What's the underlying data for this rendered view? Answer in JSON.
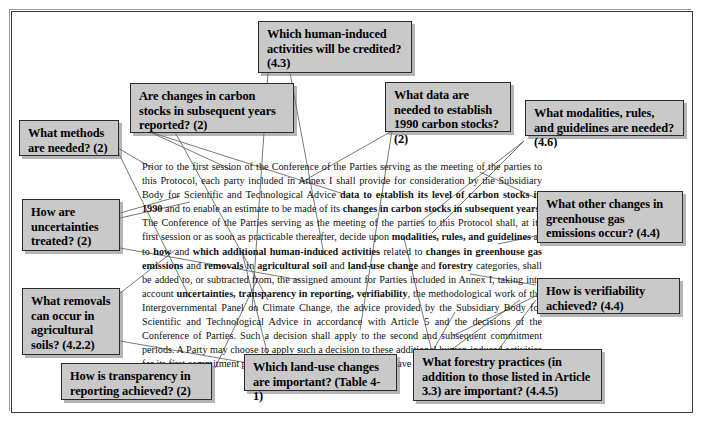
{
  "figure": {
    "kind": "annotated-text-diagram",
    "frame_color": "#3a3a3a",
    "box_fill": "#c9c9c9",
    "box_border": "#2b2b2b",
    "background": "#ffffff"
  },
  "body_paragraph": {
    "segments": [
      {
        "text": "Prior to the first session of the Conference of the Parties serving as the meeting of the parties to this Protocol, each party included in Annex I shall provide for consideration by the Subsidiary Body for Scientific and Technological Advice ",
        "bold": false
      },
      {
        "text": "data to establish its level of carbon stocks in 1990",
        "bold": true
      },
      {
        "text": " and to enable an estimate to be made of its ",
        "bold": false
      },
      {
        "text": "changes in carbon stocks in subsequent years",
        "bold": true
      },
      {
        "text": ". The Conference of the Parties serving as the meeting of the parties to this Protocol shall, at its first session or as soon as practicable thereafter, decide upon ",
        "bold": false
      },
      {
        "text": "modalities, rules, and guidelines",
        "bold": true
      },
      {
        "text": " as to ",
        "bold": false
      },
      {
        "text": "how",
        "bold": true
      },
      {
        "text": " and ",
        "bold": false
      },
      {
        "text": "which additional human-induced activities",
        "bold": true
      },
      {
        "text": " related to ",
        "bold": false
      },
      {
        "text": "changes in greenhouse gas emissions",
        "bold": true
      },
      {
        "text": " and ",
        "bold": false
      },
      {
        "text": "removals",
        "bold": true
      },
      {
        "text": " in ",
        "bold": false
      },
      {
        "text": "agricultural soil",
        "bold": true
      },
      {
        "text": " and ",
        "bold": false
      },
      {
        "text": "land-use change",
        "bold": true
      },
      {
        "text": " and ",
        "bold": false
      },
      {
        "text": "forestry",
        "bold": true
      },
      {
        "text": " categories, shall be added to, or subtracted from, the assigned amount for Parties included in Annex I, taking into account ",
        "bold": false
      },
      {
        "text": "uncertainties, transparency in reporting, verifiability",
        "bold": true
      },
      {
        "text": ", the methodological work of the Intergovernmental Panel on Climate Change, the advice provided by the Subsidiary Body for Scientific and Technological Advice in accordance with Article 5 and the decisions of the Conference of Parties. Such a decision shall apply to the second and subsequent commitment periods. A Party may choose to apply such a decision to these additional human-induced activities for its first commitment period, provided that these activities have taken place since 1990.",
        "bold": false
      }
    ]
  },
  "callouts": [
    {
      "id": "human-induced-activities-credited",
      "text": "Which human-induced activities will be credited? (4.3)",
      "reference": "(4.3)"
    },
    {
      "id": "changes-carbon-stocks-reported",
      "text": "Are changes in carbon stocks in subsequent years reported? (2)",
      "reference": "(2)"
    },
    {
      "id": "data-establish-1990-carbon-stocks",
      "text": "What data are needed to establish 1990 carbon stocks? (2)",
      "reference": "(2)"
    },
    {
      "id": "modalities-rules-guidelines",
      "text": "What modalities, rules, and guidelines are needed? (4.6)",
      "reference": "(4.6)"
    },
    {
      "id": "methods-needed",
      "text": "What methods are needed? (2)",
      "reference": "(2)"
    },
    {
      "id": "uncertainties-treated",
      "text": "How are uncertainties treated? (2)",
      "reference": "(2)"
    },
    {
      "id": "removals-agricultural-soils",
      "text": "What removals can occur in agricultural soils? (4.2.2)",
      "reference": "(4.2.2)"
    },
    {
      "id": "other-changes-ghg-emissions",
      "text": "What other changes in greenhouse gas emissions occur? (4.4)",
      "reference": "(4.4)"
    },
    {
      "id": "verifiability-achieved",
      "text": "How is verifiability achieved? (4.4)",
      "reference": "(4.4)"
    },
    {
      "id": "transparency-reporting-achieved",
      "text": "How is transparency in reporting achieved? (2)",
      "reference": "(2)"
    },
    {
      "id": "land-use-changes-important",
      "text": "Which land-use changes are important? (Table 4-1)",
      "reference": "(Table 4-1)"
    },
    {
      "id": "forestry-practices-important",
      "text": "What forestry practices (in addition to those listed in Article 3.3) are important? (4.4.5)",
      "reference": "(4.4.5)"
    }
  ]
}
